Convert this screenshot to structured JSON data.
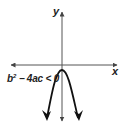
{
  "diagram": {
    "type": "parabola-graph",
    "axes": {
      "x_label": "x",
      "y_label": "y"
    },
    "curve": {
      "shape": "downward-opening parabola",
      "vertex_position": "just below x-axis",
      "x_intercepts": 0
    },
    "annotation": {
      "base": "b",
      "exponent": "2",
      "rest": " − 4ac < 0"
    },
    "colors": {
      "stroke": "#222222",
      "axis": "#555555",
      "background": "#ffffff"
    }
  }
}
